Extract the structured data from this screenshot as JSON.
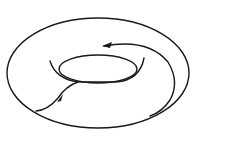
{
  "diagram": {
    "type": "torus-with-loop-paths",
    "stroke_color": "#1a1a1a",
    "background": "#ffffff",
    "elements": [
      {
        "name": "torus-outer-boundary"
      },
      {
        "name": "torus-hole-lower-edge"
      },
      {
        "name": "torus-hole-upper-edge"
      },
      {
        "name": "meridian-path",
        "arrow": "forward"
      },
      {
        "name": "longitude-path",
        "arrow": "backward"
      }
    ]
  }
}
